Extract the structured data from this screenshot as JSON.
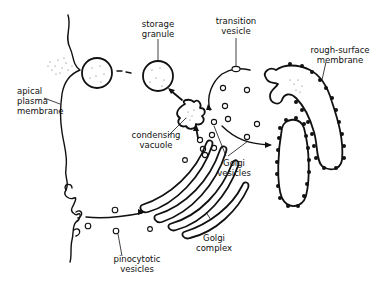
{
  "diagram": {
    "type": "biological-cell-diagram",
    "labels": {
      "storage_granule": [
        "storage",
        "granule"
      ],
      "transition_vesicle": [
        "transition",
        "vesicle"
      ],
      "rough_surface_membrane": [
        "rough-surface",
        "membrane"
      ],
      "apical_plasma_membrane": [
        "apical",
        "plasma",
        "membrane"
      ],
      "condensing_vacuole": [
        "condensing",
        "vacuole"
      ],
      "golgi_vesicles": [
        "Golgi",
        "vesicles"
      ],
      "golgi_complex": [
        "Golgi",
        "complex"
      ],
      "pinocytotic_vesicles": [
        "pinocytotic",
        "vesicles"
      ]
    },
    "colors": {
      "line": "#111111",
      "background": "#ffffff"
    }
  }
}
